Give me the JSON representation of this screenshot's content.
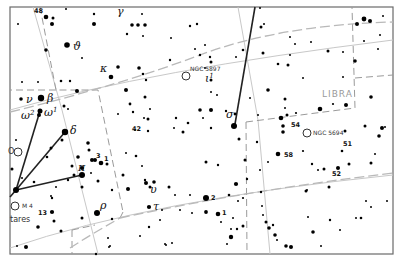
{
  "map": {
    "type": "star-chart",
    "frame": {
      "x": 10,
      "y": 7,
      "width": 383,
      "height": 247
    },
    "constellation_labels": [
      {
        "text": "LIBRA",
        "x": 322,
        "y": 97
      }
    ],
    "greek_labels": [
      {
        "text": "γ",
        "x": 117,
        "y": 15
      },
      {
        "text": "ϑ",
        "x": 73,
        "y": 50
      },
      {
        "text": "κ",
        "x": 100,
        "y": 72
      },
      {
        "text": "ι",
        "sup": "1",
        "x": 205,
        "y": 82
      },
      {
        "text": "ν",
        "x": 26,
        "y": 103
      },
      {
        "text": "β",
        "x": 47,
        "y": 102
      },
      {
        "text": "ω",
        "sup": "2",
        "x": 21,
        "y": 119
      },
      {
        "text": "ω",
        "sup": "1",
        "x": 44,
        "y": 116
      },
      {
        "text": "δ",
        "x": 70,
        "y": 134
      },
      {
        "text": "π",
        "x": 78,
        "y": 171
      },
      {
        "text": "σ",
        "x": 226,
        "y": 118
      },
      {
        "text": "υ",
        "x": 150,
        "y": 193
      },
      {
        "text": "ρ",
        "x": 100,
        "y": 209
      },
      {
        "text": "τ",
        "x": 153,
        "y": 210
      }
    ],
    "number_labels": [
      {
        "text": "48",
        "x": 34,
        "y": 13
      },
      {
        "text": "42",
        "x": 132,
        "y": 131
      },
      {
        "text": "3",
        "x": 96,
        "y": 158
      },
      {
        "text": "1",
        "x": 104,
        "y": 161
      },
      {
        "text": "13",
        "x": 38,
        "y": 215
      },
      {
        "text": "54",
        "x": 291,
        "y": 127
      },
      {
        "text": "58",
        "x": 284,
        "y": 157
      },
      {
        "text": "51",
        "x": 343,
        "y": 146
      },
      {
        "text": "52",
        "x": 332,
        "y": 176
      },
      {
        "text": "2",
        "x": 211,
        "y": 200
      },
      {
        "text": "1",
        "x": 222,
        "y": 215
      }
    ],
    "deep_sky_objects": [
      {
        "label": "NGC 5897",
        "cx": 186,
        "cy": 76,
        "lx": 190,
        "ly": 71
      },
      {
        "label": "NGC 5694",
        "cx": 307,
        "cy": 133,
        "lx": 313,
        "ly": 135
      },
      {
        "label": "M 4",
        "cx": 15,
        "cy": 206,
        "lx": 22,
        "ly": 208
      },
      {
        "label": "",
        "cx": 18,
        "cy": 152,
        "lx": 0,
        "ly": 0
      }
    ],
    "partial_labels": [
      {
        "text": "tares",
        "x": 10,
        "y": 222
      },
      {
        "text": "O",
        "x": 8,
        "y": 154
      }
    ],
    "stars": [
      [
        46,
        17,
        2.3
      ],
      [
        53,
        18,
        1.5
      ],
      [
        52,
        24,
        2
      ],
      [
        18,
        24,
        1
      ],
      [
        94,
        14,
        1.2
      ],
      [
        66,
        9,
        1
      ],
      [
        94,
        24,
        2
      ],
      [
        142,
        14,
        1
      ],
      [
        132,
        25,
        1.8
      ],
      [
        138,
        25,
        1.8
      ],
      [
        145,
        25,
        1.8
      ],
      [
        127,
        34,
        1.2
      ],
      [
        143,
        36,
        1
      ],
      [
        67,
        45,
        2.8
      ],
      [
        46,
        50,
        1.8
      ],
      [
        82,
        58,
        1
      ],
      [
        171,
        38,
        1
      ],
      [
        190,
        26,
        1.2
      ],
      [
        197,
        24,
        1.2
      ],
      [
        205,
        45,
        1
      ],
      [
        195,
        49,
        1
      ],
      [
        170,
        60,
        1.2
      ],
      [
        200,
        55,
        1.2
      ],
      [
        211,
        62,
        1.5
      ],
      [
        205,
        68,
        1
      ],
      [
        111,
        77,
        2.3
      ],
      [
        118,
        67,
        1.8
      ],
      [
        139,
        68,
        1.8
      ],
      [
        143,
        74,
        1.3
      ],
      [
        146,
        80,
        1.2
      ],
      [
        70,
        81,
        1.2
      ],
      [
        61,
        81,
        1.3
      ],
      [
        22,
        82,
        1
      ],
      [
        38,
        82,
        1
      ],
      [
        77,
        91,
        2
      ],
      [
        126,
        90,
        2
      ],
      [
        145,
        97,
        1.5
      ],
      [
        64,
        106,
        1.5
      ],
      [
        68,
        109,
        1
      ],
      [
        21,
        99,
        1.8
      ],
      [
        41,
        98,
        3.2
      ],
      [
        40,
        111,
        2.5
      ],
      [
        39,
        115,
        2
      ],
      [
        260,
        8,
        1
      ],
      [
        264,
        24,
        1
      ],
      [
        261,
        27,
        1.5
      ],
      [
        290,
        37,
        1
      ],
      [
        295,
        44,
        1
      ],
      [
        243,
        50,
        1.3
      ],
      [
        236,
        57,
        1
      ],
      [
        290,
        55,
        1
      ],
      [
        263,
        53,
        1.5
      ],
      [
        278,
        64,
        1.3
      ],
      [
        288,
        65,
        1.5
      ],
      [
        328,
        51,
        1.5
      ],
      [
        355,
        61,
        1.8
      ],
      [
        357,
        24,
        2
      ],
      [
        370,
        21,
        2
      ],
      [
        364,
        19,
        2.4
      ],
      [
        364,
        41,
        1
      ],
      [
        378,
        49,
        1
      ],
      [
        380,
        35,
        1
      ],
      [
        383,
        16,
        1
      ],
      [
        311,
        42,
        1
      ],
      [
        343,
        52,
        1
      ],
      [
        343,
        77,
        1
      ],
      [
        303,
        78,
        1
      ],
      [
        268,
        90,
        1.8
      ],
      [
        250,
        98,
        1
      ],
      [
        285,
        99,
        1.5
      ],
      [
        371,
        97,
        1.8
      ],
      [
        346,
        105,
        2
      ],
      [
        285,
        108,
        1
      ],
      [
        320,
        109,
        2.3
      ],
      [
        226,
        111,
        1.2
      ],
      [
        235,
        114,
        1.4
      ],
      [
        258,
        115,
        1
      ],
      [
        281,
        118,
        2.3
      ],
      [
        287,
        115,
        1.5
      ],
      [
        283,
        126,
        1.8
      ],
      [
        283,
        132,
        1.8
      ],
      [
        296,
        113,
        1.1
      ],
      [
        333,
        104,
        1.1
      ],
      [
        345,
        131,
        1.5
      ],
      [
        382,
        128,
        2
      ],
      [
        365,
        126,
        1.5
      ],
      [
        379,
        136,
        1.8
      ],
      [
        234,
        126,
        3
      ],
      [
        239,
        139,
        1.5
      ],
      [
        257,
        142,
        1.2
      ],
      [
        278,
        154,
        2.3
      ],
      [
        245,
        160,
        1.5
      ],
      [
        268,
        162,
        1
      ],
      [
        260,
        170,
        1
      ],
      [
        303,
        151,
        1.1
      ],
      [
        312,
        164,
        1.2
      ],
      [
        318,
        170,
        1
      ],
      [
        324,
        169,
        1.5
      ],
      [
        338,
        168,
        2
      ],
      [
        349,
        164,
        1.5
      ],
      [
        371,
        163,
        1.5
      ],
      [
        375,
        154,
        1
      ],
      [
        342,
        151,
        1.3
      ],
      [
        236,
        184,
        2.1
      ],
      [
        247,
        179,
        1.2
      ],
      [
        206,
        162,
        1.5
      ],
      [
        218,
        165,
        1.2
      ],
      [
        261,
        192,
        1.2
      ],
      [
        229,
        195,
        1.3
      ],
      [
        206,
        198,
        3
      ],
      [
        306,
        191,
        1.5
      ],
      [
        329,
        187,
        1.5
      ],
      [
        307,
        190,
        1
      ],
      [
        243,
        198,
        1.1
      ],
      [
        238,
        201,
        1
      ],
      [
        206,
        212,
        1.9
      ],
      [
        218,
        214,
        2.3
      ],
      [
        263,
        215,
        1
      ],
      [
        266,
        222,
        1.5
      ],
      [
        269,
        228,
        1.8
      ],
      [
        273,
        225,
        1.2
      ],
      [
        275,
        235,
        1.8
      ],
      [
        277,
        240,
        1
      ],
      [
        308,
        217,
        1
      ],
      [
        330,
        220,
        1.2
      ],
      [
        356,
        218,
        1
      ],
      [
        361,
        218,
        1.3
      ],
      [
        286,
        246,
        1.8
      ],
      [
        291,
        247,
        2
      ],
      [
        313,
        232,
        1.8
      ],
      [
        321,
        246,
        1
      ],
      [
        340,
        230,
        1
      ],
      [
        366,
        201,
        1
      ],
      [
        371,
        207,
        1
      ],
      [
        387,
        201,
        1
      ],
      [
        385,
        127,
        1
      ],
      [
        233,
        218,
        1
      ],
      [
        237,
        229,
        1.2
      ],
      [
        231,
        229,
        1
      ],
      [
        231,
        237,
        2.2
      ],
      [
        243,
        226,
        1.5
      ],
      [
        262,
        206,
        1
      ],
      [
        227,
        244,
        1
      ],
      [
        221,
        222,
        1
      ],
      [
        65,
        132,
        3.2
      ],
      [
        88,
        143,
        1.8
      ],
      [
        89,
        150,
        1.5
      ],
      [
        92,
        160,
        2
      ],
      [
        95,
        160,
        2
      ],
      [
        101,
        163,
        2.3
      ],
      [
        107,
        164,
        1.5
      ],
      [
        78,
        157,
        1.8
      ],
      [
        82,
        168,
        2.1
      ],
      [
        91,
        173,
        1
      ],
      [
        98,
        181,
        1.5
      ],
      [
        82,
        187,
        1.5
      ],
      [
        82,
        175,
        3
      ],
      [
        74,
        175,
        1.5
      ],
      [
        72,
        166,
        1.5
      ],
      [
        47,
        157,
        1.3
      ],
      [
        51,
        148,
        1.5
      ],
      [
        62,
        140,
        1.5
      ],
      [
        12,
        169,
        1.5
      ],
      [
        16,
        140,
        1
      ],
      [
        22,
        178,
        1
      ],
      [
        34,
        182,
        1.3
      ],
      [
        56,
        187,
        1
      ],
      [
        68,
        180,
        1.2
      ],
      [
        51,
        196,
        1
      ],
      [
        52,
        198,
        1.2
      ],
      [
        16,
        190,
        3
      ],
      [
        52,
        212,
        2.1
      ],
      [
        54,
        221,
        1.5
      ],
      [
        82,
        218,
        1.5
      ],
      [
        38,
        227,
        1.8
      ],
      [
        61,
        231,
        1.5
      ],
      [
        126,
        153,
        1
      ],
      [
        123,
        175,
        1.5
      ],
      [
        112,
        190,
        1.2
      ],
      [
        128,
        189,
        2
      ],
      [
        146,
        183,
        2
      ],
      [
        150,
        187,
        1.5
      ],
      [
        154,
        182,
        1.8
      ],
      [
        149,
        207,
        2.1
      ],
      [
        169,
        187,
        1.5
      ],
      [
        175,
        195,
        1
      ],
      [
        162,
        210,
        1
      ],
      [
        190,
        195,
        1
      ],
      [
        180,
        210,
        1
      ],
      [
        192,
        213,
        1
      ],
      [
        149,
        227,
        1.2
      ],
      [
        140,
        236,
        1
      ],
      [
        165,
        244,
        1
      ],
      [
        166,
        245,
        1
      ],
      [
        172,
        243,
        1
      ],
      [
        97,
        213,
        3
      ],
      [
        112,
        219,
        1.2
      ],
      [
        108,
        238,
        1
      ],
      [
        110,
        246,
        1
      ],
      [
        109,
        247,
        1
      ],
      [
        96,
        254,
        1.2
      ],
      [
        17,
        246,
        1
      ],
      [
        26,
        247,
        2
      ],
      [
        145,
        180,
        1.2
      ],
      [
        160,
        220,
        1
      ],
      [
        176,
        118,
        1.2
      ],
      [
        183,
        132,
        1.5
      ],
      [
        142,
        166,
        1
      ],
      [
        136,
        156,
        1.3
      ],
      [
        148,
        131,
        1.2
      ],
      [
        135,
        130,
        1
      ],
      [
        148,
        119,
        1.5
      ],
      [
        144,
        118,
        1
      ],
      [
        150,
        109,
        1
      ],
      [
        133,
        112,
        1.2
      ],
      [
        130,
        104,
        1.4
      ],
      [
        188,
        123,
        1.3
      ],
      [
        203,
        118,
        1
      ],
      [
        200,
        110,
        1.8
      ],
      [
        211,
        110,
        2
      ],
      [
        211,
        128,
        1.2
      ],
      [
        174,
        128,
        1
      ],
      [
        211,
        92,
        1
      ],
      [
        211,
        80,
        1.5
      ],
      [
        210,
        57,
        1.2
      ],
      [
        217,
        95,
        1
      ],
      [
        118,
        114,
        1
      ]
    ]
  }
}
